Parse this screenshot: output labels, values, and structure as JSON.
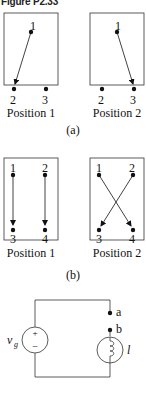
{
  "figure": {
    "title": "Figure P2.33",
    "part_a": {
      "caption": "(a)",
      "positions": [
        {
          "label": "Position 1",
          "terminals": [
            "1",
            "2",
            "3"
          ],
          "connection": "1 → 2"
        },
        {
          "label": "Position 2",
          "terminals": [
            "1",
            "2",
            "3"
          ],
          "connection": "1 → 3"
        }
      ]
    },
    "part_b": {
      "caption": "(b)",
      "positions": [
        {
          "label": "Position 1",
          "terminals": [
            "1",
            "2",
            "3",
            "4"
          ],
          "connections": [
            "1 → 3",
            "2 → 4"
          ]
        },
        {
          "label": "Position 2",
          "terminals": [
            "1",
            "2",
            "3",
            "4"
          ],
          "connections": [
            "1 → 4",
            "2 → 3"
          ]
        }
      ]
    },
    "circuit": {
      "source_label": "v",
      "source_subscript": "g",
      "plus": "+",
      "minus": "−",
      "terminal_a": "a",
      "terminal_b": "b",
      "lamp_label": "l"
    }
  }
}
